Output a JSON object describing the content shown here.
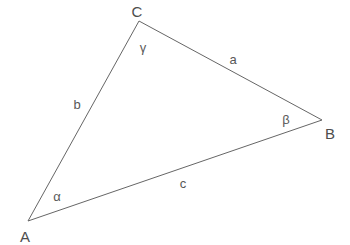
{
  "diagram": {
    "type": "geometry-triangle",
    "background_color": "#ffffff",
    "stroke_color": "#666666",
    "stroke_width": 1,
    "label_color": "#555555",
    "canvas": {
      "width": 350,
      "height": 245
    },
    "vertices": [
      {
        "id": "A",
        "label": "A",
        "x": 28,
        "y": 221,
        "label_x": 25,
        "label_y": 236
      },
      {
        "id": "B",
        "label": "B",
        "x": 322,
        "y": 120,
        "label_x": 330,
        "label_y": 133
      },
      {
        "id": "C",
        "label": "C",
        "x": 139,
        "y": 21,
        "label_x": 137,
        "label_y": 11
      }
    ],
    "sides": [
      {
        "id": "a",
        "label": "a",
        "from": "B",
        "to": "C",
        "label_x": 233,
        "label_y": 59
      },
      {
        "id": "b",
        "label": "b",
        "from": "C",
        "to": "A",
        "label_x": 77,
        "label_y": 104
      },
      {
        "id": "c",
        "label": "c",
        "from": "A",
        "to": "B",
        "label_x": 183,
        "label_y": 183
      }
    ],
    "angles": [
      {
        "id": "alpha",
        "label": "α",
        "at_vertex": "A",
        "label_x": 57,
        "label_y": 196
      },
      {
        "id": "beta",
        "label": "β",
        "at_vertex": "B",
        "label_x": 286,
        "label_y": 119
      },
      {
        "id": "gamma",
        "label": "γ",
        "at_vertex": "C",
        "label_x": 143,
        "label_y": 47
      }
    ],
    "polygon_points": "28,221 139,21 322,120"
  }
}
